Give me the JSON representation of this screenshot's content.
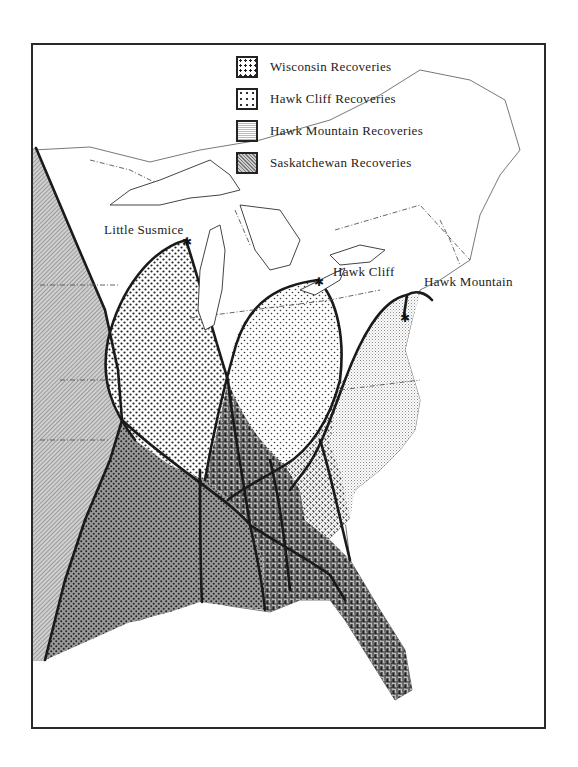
{
  "legend": {
    "items": [
      {
        "label": "Wisconsin Recoveries",
        "pattern": "wisconsin"
      },
      {
        "label": "Hawk Cliff Recoveries",
        "pattern": "hawkcliff"
      },
      {
        "label": "Hawk Mountain Recoveries",
        "pattern": "hawkmountain"
      },
      {
        "label": "Saskatchewan Recoveries",
        "pattern": "saskatchewan"
      }
    ]
  },
  "places": {
    "little_susmice": "Little Susmice",
    "hawk_cliff": "Hawk Cliff",
    "hawk_mountain": "Hawk Mountain"
  },
  "colors": {
    "ink": "#222222",
    "paper": "#ffffff",
    "frame": "#2a2a2a"
  }
}
